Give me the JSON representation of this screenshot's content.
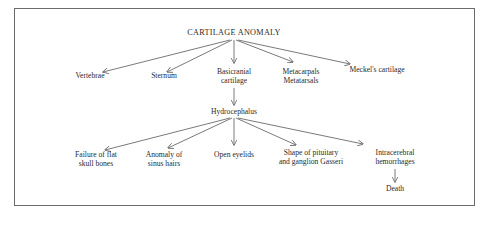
{
  "diagram": {
    "root": "CARTILAGE ANOMALY",
    "level1": [
      {
        "line1": "Vertebrae",
        "line2": ""
      },
      {
        "line1": "Sternum",
        "line2": ""
      },
      {
        "line1": "Basicranial",
        "line2": "cartilage"
      },
      {
        "line1": "Metacarpals",
        "line2": "Metatarsals"
      },
      {
        "line1": "Meckel's cartilage",
        "line2": ""
      }
    ],
    "middle": "Hydrocephalus",
    "level2": [
      {
        "line1": "Failure of flat",
        "line2": "skull bones"
      },
      {
        "line1": "Anomaly of",
        "line2": "sinus hairs"
      },
      {
        "line1": "Open eyelids",
        "line2": ""
      },
      {
        "line1": "Shape of pituitary",
        "line2": "and ganglion Gasseri"
      },
      {
        "line1": "Intracerebral",
        "line2": "hemorrhages"
      }
    ],
    "terminal": "Death"
  }
}
